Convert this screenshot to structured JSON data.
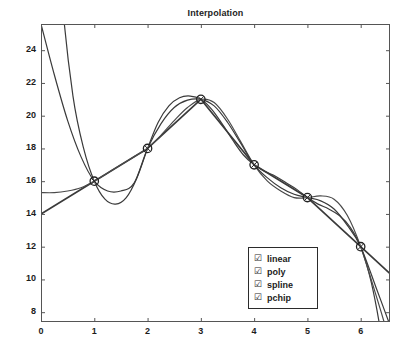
{
  "chart_data": {
    "type": "line",
    "title": "Interpolation",
    "xlabel": "",
    "ylabel": "",
    "xlim": [
      0,
      6.55
    ],
    "ylim": [
      7.4,
      25.6
    ],
    "xticks": [
      "0",
      "1",
      "2",
      "3",
      "4",
      "5",
      "6"
    ],
    "xtick_values": [
      0,
      1,
      2,
      3,
      4,
      5,
      6
    ],
    "yticks": [
      "8",
      "10",
      "12",
      "14",
      "16",
      "18",
      "20",
      "22",
      "24"
    ],
    "ytick_values": [
      8,
      10,
      12,
      14,
      16,
      18,
      20,
      22,
      24
    ],
    "grid": false,
    "legend_position": "lower right",
    "data_points": {
      "name": "data",
      "marker": "circle-cross",
      "x": [
        1,
        2,
        3,
        4,
        5,
        6
      ],
      "y": [
        16,
        18,
        21,
        17,
        15,
        12
      ]
    },
    "series": [
      {
        "name": "linear",
        "color": "#3a3a3a",
        "x": [
          0,
          1,
          2,
          3,
          4,
          5,
          6,
          6.55
        ],
        "y": [
          14.0,
          16.0,
          18.0,
          21.0,
          17.0,
          15.0,
          12.0,
          10.35
        ]
      },
      {
        "name": "poly",
        "color": "#3a3a3a",
        "x": [
          0,
          0.2,
          0.4,
          0.6,
          0.8,
          1.0,
          1.2,
          1.4,
          1.6,
          1.8,
          2.0,
          2.2,
          2.4,
          2.6,
          2.8,
          3.0,
          3.2,
          3.4,
          3.6,
          3.8,
          4.0,
          4.2,
          4.4,
          4.6,
          4.8,
          5.0,
          5.2,
          5.4,
          5.6,
          5.8,
          6.0,
          6.2,
          6.4,
          6.55
        ],
        "y": [
          54.0,
          37.2,
          27.0,
          21.2,
          18.0,
          16.0,
          14.9,
          14.6,
          15.0,
          16.2,
          18.0,
          19.6,
          20.6,
          21.1,
          21.2,
          21.0,
          20.4,
          19.5,
          18.5,
          17.6,
          17.0,
          16.6,
          16.3,
          15.9,
          15.5,
          15.0,
          14.6,
          14.3,
          13.9,
          13.2,
          12.0,
          9.8,
          6.3,
          2.5
        ]
      },
      {
        "name": "spline",
        "color": "#4a4a4a",
        "x": [
          0,
          0.25,
          0.5,
          0.75,
          1.0,
          1.25,
          1.5,
          1.75,
          2.0,
          2.25,
          2.5,
          2.75,
          3.0,
          3.25,
          3.5,
          3.75,
          4.0,
          4.25,
          4.5,
          4.75,
          5.0,
          5.25,
          5.5,
          5.75,
          6.0,
          6.3,
          6.55
        ],
        "y": [
          15.3,
          15.3,
          15.4,
          15.6,
          16.0,
          16.5,
          17.0,
          17.5,
          18.0,
          18.8,
          19.7,
          20.5,
          21.0,
          20.8,
          19.8,
          18.4,
          17.0,
          16.0,
          15.4,
          15.0,
          15.0,
          15.1,
          14.9,
          13.9,
          12.0,
          8.9,
          6.2
        ]
      },
      {
        "name": "pchip",
        "color": "#3a3a3a",
        "x": [
          0,
          0.25,
          0.5,
          0.75,
          1.0,
          1.25,
          1.5,
          1.75,
          2.0,
          2.25,
          2.5,
          2.75,
          3.0,
          3.25,
          3.5,
          3.75,
          4.0,
          4.25,
          4.5,
          4.75,
          5.0,
          5.25,
          5.5,
          5.75,
          6.0,
          6.3,
          6.55
        ],
        "y": [
          25.6,
          22.5,
          19.7,
          17.5,
          16.0,
          15.4,
          15.4,
          15.9,
          18.0,
          19.5,
          20.5,
          20.95,
          21.0,
          20.6,
          19.6,
          18.3,
          17.0,
          16.2,
          15.6,
          15.2,
          15.0,
          14.8,
          14.3,
          13.3,
          12.0,
          9.4,
          7.2
        ]
      }
    ]
  },
  "legend": {
    "checkbox_glyph": "☑",
    "items": [
      {
        "label": "linear"
      },
      {
        "label": "poly"
      },
      {
        "label": "spline"
      },
      {
        "label": "pchip"
      }
    ]
  }
}
